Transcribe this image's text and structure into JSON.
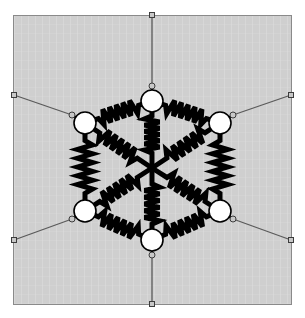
{
  "figure": {
    "panel": {
      "x": 13,
      "y": 15,
      "width": 279,
      "height": 290,
      "background_color": "#cfcfcf",
      "border_color": "#8a8a8a",
      "border_width": 1
    },
    "colors": {
      "wire": "#000000",
      "node_fill": "#ffffff",
      "node_stroke": "#000000",
      "lead_line": "#5a5a5a",
      "terminal_fill": "#c8c8c8",
      "terminal_stroke": "#3c3c3c",
      "background": "#cfcfcf"
    },
    "geometry": {
      "center": {
        "x": 152,
        "y": 168
      },
      "node_radius": 11,
      "hub_radius": 0,
      "wire_width": 5,
      "spoke_count": 6,
      "ring_resistor_count": 6,
      "spoke_resistor_count": 6,
      "terminal_count": 6,
      "resistor_zigzag_peaks": 6
    },
    "nodes": [
      {
        "id": "N1",
        "label": "top",
        "angle_deg": -90,
        "x": 152,
        "y": 101
      },
      {
        "id": "N2",
        "label": "upper-right",
        "angle_deg": -30,
        "x": 220,
        "y": 123
      },
      {
        "id": "N3",
        "label": "lower-right",
        "angle_deg": 30,
        "x": 220,
        "y": 211
      },
      {
        "id": "N4",
        "label": "bottom",
        "angle_deg": 90,
        "x": 152,
        "y": 240
      },
      {
        "id": "N5",
        "label": "lower-left",
        "angle_deg": 150,
        "x": 85,
        "y": 211
      },
      {
        "id": "N6",
        "label": "upper-left",
        "angle_deg": -150,
        "x": 85,
        "y": 123
      }
    ],
    "ring_resistors": [
      {
        "id": "R12",
        "from": "N1",
        "to": "N2"
      },
      {
        "id": "R23",
        "from": "N2",
        "to": "N3"
      },
      {
        "id": "R34",
        "from": "N3",
        "to": "N4"
      },
      {
        "id": "R45",
        "from": "N4",
        "to": "N5"
      },
      {
        "id": "R56",
        "from": "N5",
        "to": "N6"
      },
      {
        "id": "R61",
        "from": "N6",
        "to": "N1"
      }
    ],
    "spoke_resistors": [
      {
        "id": "RC1",
        "from": "N1",
        "to": "center"
      },
      {
        "id": "RC2",
        "from": "N2",
        "to": "center"
      },
      {
        "id": "RC3",
        "from": "N3",
        "to": "center"
      },
      {
        "id": "RC4",
        "from": "N4",
        "to": "center"
      },
      {
        "id": "RC5",
        "from": "N5",
        "to": "center"
      },
      {
        "id": "RC6",
        "from": "N6",
        "to": "center"
      }
    ],
    "terminals": [
      {
        "id": "T1",
        "node": "N1",
        "x": 152,
        "y": 15,
        "shape": "square",
        "position": "top-edge"
      },
      {
        "id": "T2",
        "node": "N2",
        "x": 291,
        "y": 95,
        "shape": "square",
        "position": "right-upper-corner"
      },
      {
        "id": "T3",
        "node": "N3",
        "x": 291,
        "y": 240,
        "shape": "square",
        "position": "right-lower-corner"
      },
      {
        "id": "T4",
        "node": "N4",
        "x": 152,
        "y": 304,
        "shape": "square",
        "position": "bottom-edge"
      },
      {
        "id": "T5",
        "node": "N5",
        "x": 14,
        "y": 240,
        "shape": "square",
        "position": "left-lower-corner"
      },
      {
        "id": "T6",
        "node": "N6",
        "x": 14,
        "y": 95,
        "shape": "square",
        "position": "left-upper-corner"
      }
    ],
    "lead_joints": [
      {
        "id": "J1",
        "node": "N1",
        "x": 152,
        "y": 86
      },
      {
        "id": "J2",
        "node": "N2",
        "x": 233,
        "y": 115
      },
      {
        "id": "J3",
        "node": "N3",
        "x": 233,
        "y": 219
      },
      {
        "id": "J4",
        "node": "N4",
        "x": 152,
        "y": 255
      },
      {
        "id": "J5",
        "node": "N5",
        "x": 72,
        "y": 219
      },
      {
        "id": "J6",
        "node": "N6",
        "x": 72,
        "y": 115
      }
    ]
  }
}
